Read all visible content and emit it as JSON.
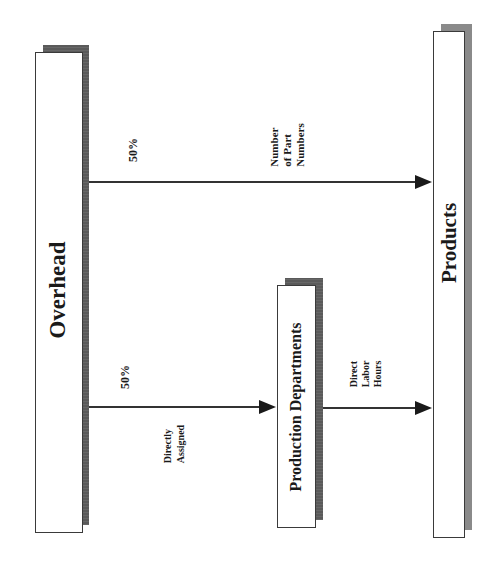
{
  "diagram": {
    "orientation": "rotated-90-ccw",
    "nodes": {
      "overhead": {
        "label": "Overhead"
      },
      "production_departments": {
        "label": "Production Departments"
      },
      "products": {
        "label": "Products"
      }
    },
    "edges": {
      "overhead_to_products": {
        "percent": "50%",
        "driver_lines": [
          "Number",
          "of Part",
          "Numbers"
        ]
      },
      "overhead_to_production": {
        "percent": "50%",
        "driver_lines": [
          "Directly",
          "Assigned"
        ]
      },
      "production_to_products": {
        "driver_lines": [
          "Direct",
          "Labor",
          "Hours"
        ]
      }
    },
    "colors": {
      "box_border": "#3a3a3a",
      "shadow": "#5a5a5a",
      "arrow": "#1a1a1a"
    }
  }
}
